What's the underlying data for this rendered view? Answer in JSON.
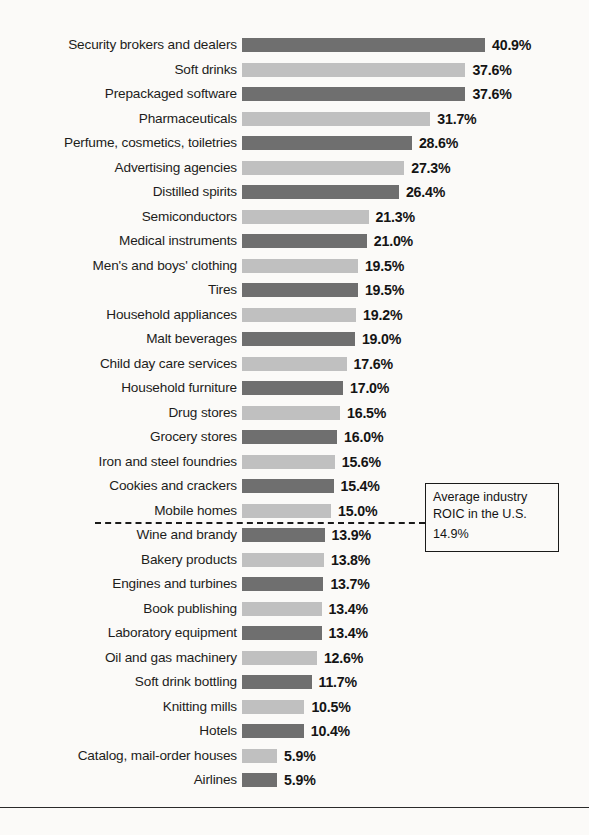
{
  "chart_data": {
    "type": "bar",
    "orientation": "horizontal",
    "title": "",
    "subtitle": "",
    "xlabel": "",
    "ylabel": "",
    "value_suffix": "%",
    "grid": false,
    "legend": null,
    "xlim": [
      0,
      40.9
    ],
    "categories": [
      "Security brokers and dealers",
      "Soft drinks",
      "Prepackaged software",
      "Pharmaceuticals",
      "Perfume, cosmetics, toiletries",
      "Advertising agencies",
      "Distilled spirits",
      "Semiconductors",
      "Medical instruments",
      "Men's and boys' clothing",
      "Tires",
      "Household appliances",
      "Malt beverages",
      "Child day care services",
      "Household furniture",
      "Drug stores",
      "Grocery stores",
      "Iron and steel foundries",
      "Cookies and crackers",
      "Mobile homes",
      "Wine and brandy",
      "Bakery products",
      "Engines and turbines",
      "Book publishing",
      "Laboratory equipment",
      "Oil and gas machinery",
      "Soft drink bottling",
      "Knitting mills",
      "Hotels",
      "Catalog, mail-order houses",
      "Airlines"
    ],
    "values": [
      40.9,
      37.6,
      37.6,
      31.7,
      28.6,
      27.3,
      26.4,
      21.3,
      21.0,
      19.5,
      19.5,
      19.2,
      19.0,
      17.6,
      17.0,
      16.5,
      16.0,
      15.6,
      15.4,
      15.0,
      13.9,
      13.8,
      13.7,
      13.4,
      13.4,
      12.6,
      11.7,
      10.5,
      10.4,
      5.9,
      5.9
    ],
    "value_labels": [
      "40.9%",
      "37.6%",
      "37.6%",
      "31.7%",
      "28.6%",
      "27.3%",
      "26.4%",
      "21.3%",
      "21.0%",
      "19.5%",
      "19.5%",
      "19.2%",
      "19.0%",
      "17.6%",
      "17.0%",
      "16.5%",
      "16.0%",
      "15.6%",
      "15.4%",
      "15.0%",
      "13.9%",
      "13.8%",
      "13.7%",
      "13.4%",
      "13.4%",
      "12.6%",
      "11.7%",
      "10.5%",
      "10.4%",
      "5.9%",
      "5.9%"
    ],
    "bar_colors": {
      "dark": "#6f6f6f",
      "light": "#c0c0c0",
      "pattern": "alternating-dark-light"
    },
    "reference_line": {
      "label_line_1": "Average industry",
      "label_line_2": "ROIC in the U.S.",
      "value_label": "14.9%",
      "value": 14.9,
      "style": "dashed",
      "color": "#1a1a1a"
    }
  }
}
